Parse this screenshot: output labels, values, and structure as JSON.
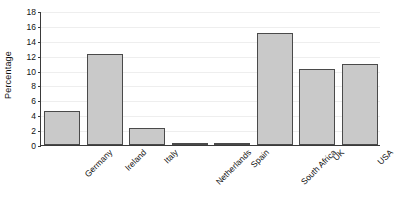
{
  "chart_data": {
    "type": "bar",
    "title": "",
    "xlabel": "",
    "ylabel": "Percentage",
    "ylim": [
      0,
      18
    ],
    "yticks": [
      0,
      2,
      4,
      6,
      8,
      10,
      12,
      14,
      16,
      18
    ],
    "ytick_labels": [
      "0",
      "2",
      "4",
      "6",
      "8",
      "10",
      "12",
      "14",
      "16",
      "18"
    ],
    "grid": true,
    "legend": false,
    "categories": [
      "Germany",
      "Ireland",
      "Italy",
      "Netherlands",
      "Spain",
      "South Africa",
      "UK",
      "USA"
    ],
    "values": [
      4.6,
      12.2,
      2.3,
      0.3,
      0.25,
      15.0,
      10.2,
      10.9
    ],
    "bar_color": "#c9c9c9",
    "bar_edge_color": "#4a4a4a",
    "axis_color": "#3a3a3a",
    "grid_color": "#eeeeee",
    "background_color": "#ffffff"
  }
}
